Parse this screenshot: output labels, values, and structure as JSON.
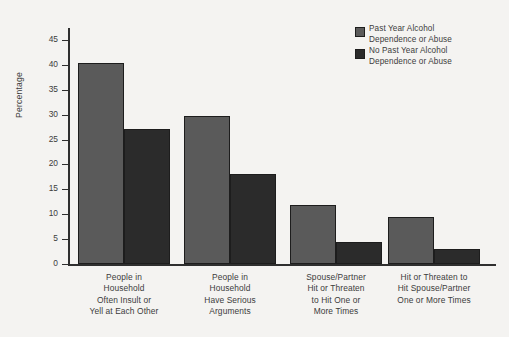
{
  "chart_data": {
    "type": "bar",
    "title": "",
    "subtitle": "",
    "xlabel": "",
    "ylabel": "Percentage",
    "ylim": [
      0,
      45
    ],
    "ytick_step": 5,
    "yticks": [
      0,
      5,
      10,
      15,
      20,
      25,
      30,
      35,
      40,
      45
    ],
    "grid": false,
    "legend_position": "top-right",
    "categories": [
      "People in Household Often Insult or Yell at Each Other",
      "People in Household Have Serious Arguments",
      "Spouse/Partner Hit or Threaten to Hit One or More Times",
      "Hit or Threaten to Hit Spouse/Partner One or More Times"
    ],
    "category_lines": [
      [
        "People in",
        "Household",
        "Often Insult or",
        "Yell at Each Other"
      ],
      [
        "People in",
        "Household",
        "Have Serious",
        "Arguments"
      ],
      [
        "Spouse/Partner",
        "Hit or Threaten",
        "to Hit One or",
        "More Times"
      ],
      [
        "Hit or Threaten to",
        "Hit Spouse/Partner",
        "One or More Times"
      ]
    ],
    "series": [
      {
        "name": "Past Year Alcohol Dependence or Abuse",
        "name_lines": [
          "Past Year Alcohol",
          "Dependence or Abuse"
        ],
        "color": "#5a5a5a",
        "values": [
          40.3,
          29.7,
          11.9,
          9.5
        ]
      },
      {
        "name": "No Past Year Alcohol Dependence or Abuse",
        "name_lines": [
          "No Past Year Alcohol",
          "Dependence or Abuse"
        ],
        "color": "#2b2b2b",
        "values": [
          27.2,
          18.0,
          4.4,
          3.1
        ]
      }
    ]
  },
  "colors": {
    "background": "#f4f3f1",
    "axis": "#2f2f2f",
    "text": "#3c3c3c",
    "series_1": "#5a5a5a",
    "series_2": "#2b2b2b"
  }
}
